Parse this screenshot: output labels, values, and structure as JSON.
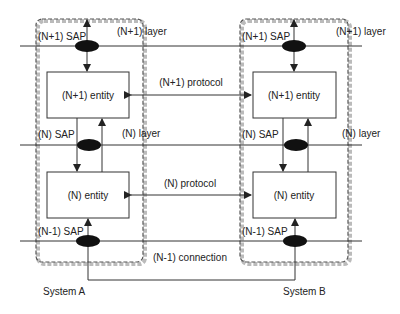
{
  "diagram": {
    "type": "OSI layered protocol model",
    "colors": {
      "line": "#333333",
      "sap_fill": "#111111",
      "dashed_border": "#555555",
      "shadow": "#bbbbbb"
    },
    "systems": [
      {
        "name": "System A",
        "sap_labels": [
          "(N+1) SAP",
          "(N) SAP",
          "(N-1) SAP"
        ],
        "entities": [
          "(N+1) entity",
          "(N) entity"
        ]
      },
      {
        "name": "System B",
        "sap_labels": [
          "(N+1) SAP",
          "(N) SAP",
          "(N-1) SAP"
        ],
        "entities": [
          "(N+1) entity",
          "(N) entity"
        ]
      }
    ],
    "layers": {
      "upper": "(N+1) layer",
      "middle": "(N) layer"
    },
    "protocols": {
      "upper": "(N+1) protocol",
      "middle": "(N) protocol"
    },
    "connection": "(N-1) connection"
  }
}
